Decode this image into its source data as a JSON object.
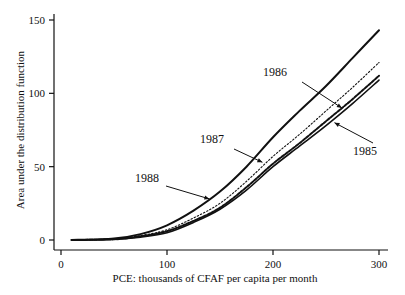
{
  "chart_data": {
    "type": "line",
    "title": "",
    "xlabel": "PCE: thousands of CFAF per capita per month",
    "ylabel": "Area under the distribution function",
    "xlim": [
      0,
      300
    ],
    "ylim": [
      0,
      150
    ],
    "xticks": [
      0,
      100,
      200,
      300
    ],
    "yticks": [
      0,
      50,
      100,
      150
    ],
    "grid": false,
    "legend": "none (inline annotations with arrows)",
    "x": [
      10,
      50,
      75,
      100,
      125,
      150,
      175,
      200,
      225,
      250,
      275,
      300
    ],
    "series": [
      {
        "name": "1988",
        "style": "solid-thick",
        "values": [
          0,
          1,
          4,
          10,
          20,
          33,
          50,
          70,
          88,
          105,
          124,
          143
        ]
      },
      {
        "name": "1987",
        "style": "dotted",
        "values": [
          0,
          0.7,
          3,
          7,
          15,
          25,
          40,
          57,
          72,
          88,
          104,
          121
        ]
      },
      {
        "name": "1986",
        "style": "dashed-thick",
        "values": [
          0,
          0.5,
          2.5,
          6,
          13,
          22,
          36,
          52,
          66,
          81,
          96,
          112
        ]
      },
      {
        "name": "1985",
        "style": "solid",
        "values": [
          0,
          0.5,
          2,
          5,
          12,
          21,
          34,
          50,
          64,
          78,
          93,
          109
        ]
      }
    ],
    "annotations": [
      {
        "text": "1988",
        "x_px": 147,
        "y_px": 182
      },
      {
        "text": "1987",
        "x_px": 212,
        "y_px": 143
      },
      {
        "text": "1986",
        "x_px": 275,
        "y_px": 76
      },
      {
        "text": "1985",
        "x_px": 365,
        "y_px": 155
      }
    ]
  }
}
